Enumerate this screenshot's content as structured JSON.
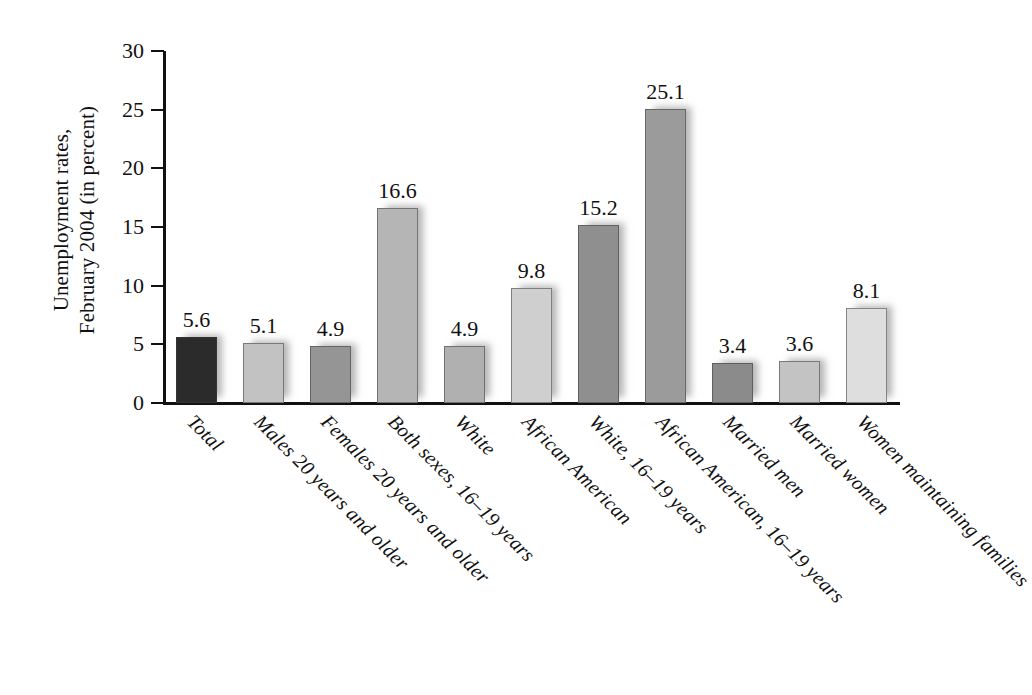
{
  "chart_data": {
    "type": "bar",
    "title": "",
    "subtitle": "",
    "xlabel": "",
    "ylabel": "Unemployment rates, February 2004 (in percent)",
    "ylabel_lines": [
      "Unemployment rates,",
      "February 2004 (in percent)"
    ],
    "ylim": [
      0,
      30
    ],
    "yticks": [
      0,
      5,
      10,
      15,
      20,
      25,
      30
    ],
    "ytick_labels": [
      "0",
      "5",
      "10",
      "15",
      "20",
      "25",
      "30"
    ],
    "grid": false,
    "legend": "none",
    "categories": [
      "Total",
      "Males 20 years and older",
      "Females 20 years and older",
      "Both sexes, 16–19 years",
      "White",
      "African American",
      "White, 16–19 years",
      "African American, 16–19 years",
      "Married men",
      "Married women",
      "Women maintaining families"
    ],
    "values": [
      5.6,
      5.1,
      4.9,
      16.6,
      4.9,
      9.8,
      15.2,
      25.1,
      3.4,
      3.6,
      8.1
    ],
    "value_labels": [
      "5.6",
      "5.1",
      "4.9",
      "16.6",
      "4.9",
      "9.8",
      "15.2",
      "25.1",
      "3.4",
      "3.6",
      "8.1"
    ],
    "bar_colors": [
      "#2b2b2b",
      "#c2c2c2",
      "#959595",
      "#b5b5b5",
      "#b0b0b0",
      "#cfcfcf",
      "#8f8f8f",
      "#9b9b9b",
      "#8b8b8b",
      "#c3c3c3",
      "#dedede"
    ],
    "axis_color": "#111111",
    "text_color": "#111111",
    "background": "#ffffff"
  }
}
